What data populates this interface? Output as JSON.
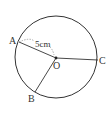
{
  "diagram": {
    "type": "circle-radii",
    "center": {
      "label": "O",
      "x": 56,
      "y": 57
    },
    "radius_px": 41,
    "points": [
      {
        "label": "A",
        "x": 16,
        "y": 42
      },
      {
        "label": "B",
        "x": 35,
        "y": 93
      },
      {
        "label": "C",
        "x": 97,
        "y": 60
      }
    ],
    "measurement": {
      "label": "5cm",
      "between": [
        "A",
        "O"
      ],
      "style": "dashed"
    },
    "colors": {
      "stroke": "#333333",
      "dashed": "#666666",
      "background": "#ffffff"
    }
  }
}
